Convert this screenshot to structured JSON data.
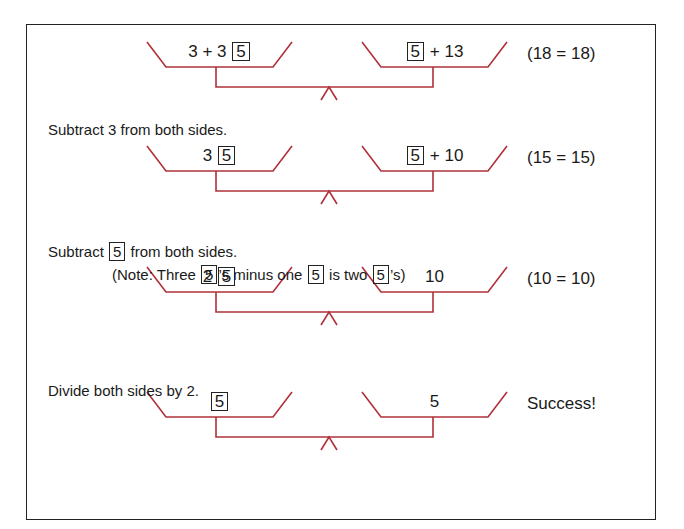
{
  "diagram": {
    "line_color": "#b0303a",
    "unknown_value": "5",
    "steps": [
      {
        "left_prefix": "3 + 3",
        "left_box": "5",
        "left_suffix": "",
        "right_prefix": "",
        "right_box": "5",
        "right_suffix": "+ 13",
        "check": "(18 = 18)"
      },
      {
        "left_prefix": "3",
        "left_box": "5",
        "left_suffix": "",
        "right_prefix": "",
        "right_box": "5",
        "right_suffix": "+ 10",
        "check": "(15 = 15)"
      },
      {
        "left_prefix": "2",
        "left_box": "5",
        "left_suffix": "",
        "right_prefix": "",
        "right_box": "",
        "right_suffix": "10",
        "check": "(10 = 10)"
      },
      {
        "left_prefix": "",
        "left_box": "5",
        "left_suffix": "",
        "right_prefix": "",
        "right_box": "",
        "right_suffix": "5",
        "check": "Success!"
      }
    ],
    "instructions": {
      "step1": "Subtract 3 from both sides.",
      "step2_pre": "Subtract",
      "step2_box": "5",
      "step2_post": "from both sides.",
      "note_a": "(Note: Three",
      "note_box1": "5",
      "note_b": "’s minus one",
      "note_box2": "5",
      "note_c": "is two",
      "note_box3": "5",
      "note_d": "’s)",
      "step3": "Divide both sides by 2."
    }
  }
}
